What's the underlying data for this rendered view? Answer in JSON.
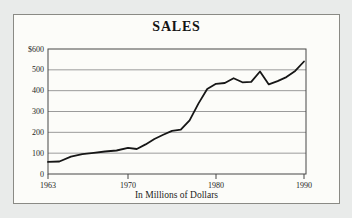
{
  "page": {
    "background": "#e9ebea"
  },
  "card": {
    "background": "#fcfcf9",
    "border_color": "#8a8a85"
  },
  "chart_data": {
    "type": "line",
    "title": "SALES",
    "caption": "In Millions of Dollars",
    "x": [
      1963,
      1964,
      1965,
      1966,
      1967,
      1968,
      1969,
      1970,
      1971,
      1972,
      1973,
      1974,
      1975,
      1976,
      1977,
      1978,
      1979,
      1980,
      1981,
      1982,
      1983,
      1984,
      1985,
      1986,
      1987,
      1988,
      1989,
      1990
    ],
    "values": [
      58,
      60,
      83,
      95,
      102,
      108,
      113,
      126,
      120,
      142,
      168,
      188,
      207,
      213,
      258,
      338,
      408,
      433,
      437,
      460,
      440,
      442,
      492,
      430,
      446,
      465,
      495,
      540
    ],
    "series_name": "Sales (millions of dollars)",
    "x_tick_years": [
      1963,
      1970,
      1980,
      1990
    ],
    "x_tick_labels": [
      "1963",
      "1970",
      "1980",
      "1990"
    ],
    "y_tick_values": [
      600,
      500,
      400,
      300,
      200,
      100,
      0
    ],
    "y_tick_labels": [
      "$600",
      "500",
      "400",
      "300",
      "200",
      "100",
      "0"
    ],
    "ylim": [
      0,
      600
    ],
    "grid": "horizontal",
    "legend": "none",
    "line_color": "#161616",
    "grid_color": "#9b9b9b",
    "frame_color": "#474747",
    "tick_color": "#474747"
  }
}
